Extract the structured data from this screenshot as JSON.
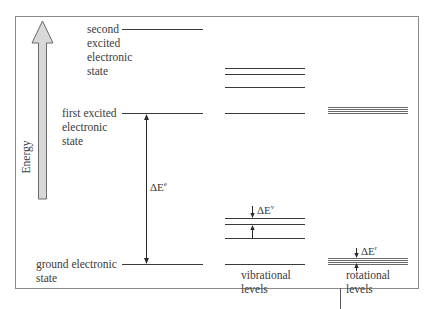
{
  "diagram": {
    "axis_label": "Energy",
    "electronic_states": [
      {
        "id": "second",
        "label_lines": [
          "second",
          "excited",
          "electronic",
          "state"
        ]
      },
      {
        "id": "first",
        "label_lines": [
          "first excited",
          "electronic",
          "state"
        ]
      },
      {
        "id": "ground",
        "label_lines": [
          "ground electronic",
          "state"
        ]
      }
    ],
    "delta_labels": {
      "electronic": {
        "base": "ΔE",
        "sup": "e"
      },
      "vibrational": {
        "base": "ΔE",
        "sup": "v"
      },
      "rotational": {
        "base": "ΔE",
        "sup": "r"
      }
    },
    "column_labels": {
      "vibrational": [
        "vibrational",
        "levels"
      ],
      "rotational": [
        "rotational",
        "levels"
      ]
    },
    "colors": {
      "frame": "#8a8a8a",
      "line": "#3a3a3a",
      "arrow_fill": "#d8d8d8",
      "arrow_stroke": "#6a6a6a",
      "rot_line": "#6a6a6a"
    }
  }
}
